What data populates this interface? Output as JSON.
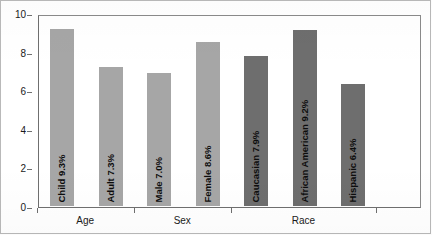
{
  "chart_data": {
    "type": "bar",
    "title": "",
    "xlabel": "",
    "ylabel": "",
    "ylim": [
      0,
      10
    ],
    "yticks": [
      "0",
      "2",
      "4",
      "6",
      "8",
      "10"
    ],
    "grid": false,
    "legend_position": "none",
    "categories": [
      "Child",
      "Adult",
      "Male",
      "Female",
      "Caucasian",
      "African American",
      "Hispanic"
    ],
    "values": [
      9.3,
      7.3,
      7.0,
      8.6,
      7.9,
      9.2,
      6.4
    ],
    "bar_labels": [
      "Child 9.3%",
      "Adult 7.3%",
      "Male 7.0%",
      "Female 8.6%",
      "Caucasian 7.9%",
      "African American 9.2%",
      "Hispanic 6.4%"
    ],
    "groups": [
      {
        "name": "Age",
        "categories": [
          "Child",
          "Adult"
        ]
      },
      {
        "name": "Sex",
        "categories": [
          "Male",
          "Female"
        ]
      },
      {
        "name": "Race",
        "categories": [
          "Caucasian",
          "African American",
          "Hispanic"
        ]
      }
    ],
    "series": [
      {
        "name": "Percent",
        "values": [
          9.3,
          7.3,
          7.0,
          8.6,
          7.9,
          9.2,
          6.4
        ]
      }
    ],
    "colors": {
      "bar_light": "#a6a6a6",
      "bar_dark": "#6e6e6e",
      "axis": "#6f6f6f",
      "text": "#0d0d0d",
      "background": "#ffffff"
    },
    "bar_colors": [
      "#a6a6a6",
      "#a6a6a6",
      "#a6a6a6",
      "#a6a6a6",
      "#6e6e6e",
      "#6e6e6e",
      "#6e6e6e"
    ]
  }
}
